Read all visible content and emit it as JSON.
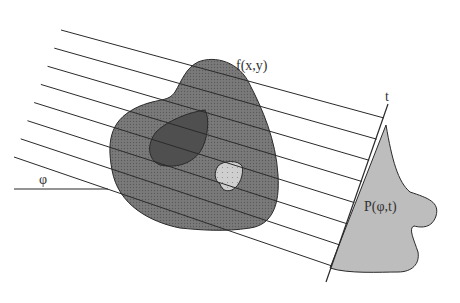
{
  "diagram": {
    "labels": {
      "object": "f(x,y)",
      "angle": "φ",
      "axis": "t",
      "projection": "P(φ,t)"
    },
    "projection_rays": {
      "count": 8
    },
    "colors": {
      "object_fill": "#6e6e6e",
      "inner_dark_region": "#4f4f4f",
      "inner_light_region": "#cfcfcf",
      "projection_fill": "#bdbdbd",
      "line": "#2a2a2a"
    }
  }
}
